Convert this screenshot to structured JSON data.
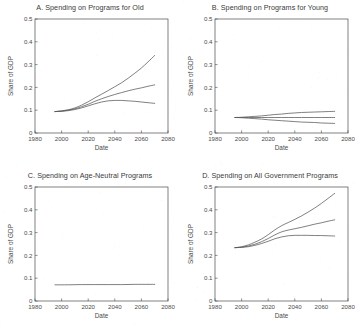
{
  "figure": {
    "background": "#ffffff",
    "line_color": "#555555",
    "axis_color": "#4a4a4a"
  },
  "axes": {
    "xlabel": "Date",
    "ylabel": "Share of GDP",
    "xticks": [
      "1980",
      "2000",
      "2020",
      "2040",
      "2060",
      "2080"
    ],
    "yticks": [
      "0",
      "0.1",
      "0.2",
      "0.3",
      "0.4",
      "0.5"
    ],
    "xlim": [
      1980,
      2080
    ],
    "ylim": [
      0,
      0.5
    ]
  },
  "chart_data": [
    {
      "type": "line",
      "panel": "A",
      "title": "A. Spending on Programs for Old",
      "xlabel": "Date",
      "ylabel": "Share of GDP",
      "xlim": [
        1980,
        2080
      ],
      "ylim": [
        0,
        0.5
      ],
      "grid": false,
      "legend": "none",
      "x": [
        1995,
        2000,
        2005,
        2010,
        2015,
        2020,
        2025,
        2030,
        2035,
        2040,
        2045,
        2050,
        2055,
        2060,
        2065,
        2070
      ],
      "series": [
        {
          "name": "high",
          "values": [
            0.094,
            0.097,
            0.102,
            0.11,
            0.122,
            0.137,
            0.154,
            0.17,
            0.186,
            0.203,
            0.22,
            0.24,
            0.262,
            0.285,
            0.312,
            0.34
          ]
        },
        {
          "name": "middle",
          "values": [
            0.094,
            0.096,
            0.1,
            0.106,
            0.115,
            0.126,
            0.139,
            0.15,
            0.16,
            0.169,
            0.177,
            0.185,
            0.192,
            0.198,
            0.205,
            0.211
          ]
        },
        {
          "name": "low",
          "values": [
            0.094,
            0.095,
            0.098,
            0.103,
            0.11,
            0.119,
            0.128,
            0.136,
            0.141,
            0.143,
            0.143,
            0.141,
            0.139,
            0.136,
            0.133,
            0.13
          ]
        }
      ]
    },
    {
      "type": "line",
      "panel": "B",
      "title": "B. Spending on Programs for Young",
      "xlabel": "Date",
      "ylabel": "Share of GDP",
      "xlim": [
        1980,
        2080
      ],
      "ylim": [
        0,
        0.5
      ],
      "grid": false,
      "legend": "none",
      "x": [
        1995,
        2000,
        2005,
        2010,
        2015,
        2020,
        2025,
        2030,
        2035,
        2040,
        2045,
        2050,
        2055,
        2060,
        2065,
        2070
      ],
      "series": [
        {
          "name": "high",
          "values": [
            0.068,
            0.069,
            0.071,
            0.073,
            0.075,
            0.078,
            0.081,
            0.083,
            0.086,
            0.088,
            0.09,
            0.091,
            0.092,
            0.093,
            0.094,
            0.095
          ]
        },
        {
          "name": "middle",
          "values": [
            0.068,
            0.068,
            0.068,
            0.068,
            0.068,
            0.068,
            0.068,
            0.068,
            0.068,
            0.068,
            0.068,
            0.068,
            0.068,
            0.068,
            0.068,
            0.068
          ]
        },
        {
          "name": "low",
          "values": [
            0.068,
            0.067,
            0.065,
            0.063,
            0.061,
            0.058,
            0.056,
            0.054,
            0.052,
            0.05,
            0.048,
            0.047,
            0.046,
            0.044,
            0.043,
            0.042
          ]
        }
      ]
    },
    {
      "type": "line",
      "panel": "C",
      "title": "C. Spending on Age-Neutral Programs",
      "xlabel": "Date",
      "ylabel": "Share of GDP",
      "xlim": [
        1980,
        2080
      ],
      "ylim": [
        0,
        0.5
      ],
      "grid": false,
      "legend": "none",
      "x": [
        1995,
        2005,
        2015,
        2025,
        2035,
        2045,
        2055,
        2065,
        2070
      ],
      "series": [
        {
          "name": "age-neutral",
          "values": [
            0.071,
            0.071,
            0.072,
            0.072,
            0.072,
            0.072,
            0.073,
            0.073,
            0.073
          ]
        }
      ]
    },
    {
      "type": "line",
      "panel": "D",
      "title": "D. Spending on All Government Programs",
      "xlabel": "Date",
      "ylabel": "Share of GDP",
      "xlim": [
        1980,
        2080
      ],
      "ylim": [
        0,
        0.5
      ],
      "grid": false,
      "legend": "none",
      "x": [
        1995,
        2000,
        2005,
        2010,
        2015,
        2020,
        2025,
        2030,
        2035,
        2040,
        2045,
        2050,
        2055,
        2060,
        2065,
        2070
      ],
      "series": [
        {
          "name": "high",
          "values": [
            0.234,
            0.238,
            0.246,
            0.258,
            0.272,
            0.291,
            0.312,
            0.33,
            0.344,
            0.358,
            0.373,
            0.39,
            0.408,
            0.428,
            0.45,
            0.472
          ]
        },
        {
          "name": "middle",
          "values": [
            0.234,
            0.236,
            0.241,
            0.249,
            0.26,
            0.274,
            0.29,
            0.303,
            0.311,
            0.317,
            0.323,
            0.33,
            0.337,
            0.343,
            0.35,
            0.356
          ]
        },
        {
          "name": "low",
          "values": [
            0.234,
            0.235,
            0.238,
            0.244,
            0.252,
            0.262,
            0.273,
            0.281,
            0.286,
            0.288,
            0.288,
            0.288,
            0.287,
            0.287,
            0.286,
            0.285
          ]
        }
      ]
    }
  ]
}
